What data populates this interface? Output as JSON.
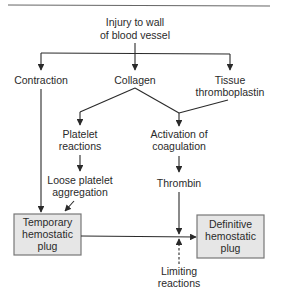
{
  "diagram": {
    "type": "flowchart",
    "colors": {
      "line": "#2a2a2a",
      "box_fill": "#e6e6e6",
      "box_border": "#777777",
      "background": "#ffffff"
    },
    "nodes": {
      "injury": {
        "line1": "Injury to wall",
        "line2": "of blood vessel"
      },
      "contraction": {
        "line1": "Contraction"
      },
      "collagen": {
        "line1": "Collagen"
      },
      "tissue": {
        "line1": "Tissue",
        "line2": "thromboplastin"
      },
      "platelet_reactions": {
        "line1": "Platelet",
        "line2": "reactions"
      },
      "activation": {
        "line1": "Activation of",
        "line2": "coagulation"
      },
      "loose": {
        "line1": "Loose platelet",
        "line2": "aggregation"
      },
      "thrombin": {
        "line1": "Thrombin"
      },
      "temporary": {
        "line1": "Temporary",
        "line2": "hemostatic",
        "line3": "plug"
      },
      "definitive": {
        "line1": "Definitive",
        "line2": "hemostatic",
        "line3": "plug"
      },
      "limiting": {
        "line1": "Limiting",
        "line2": "reactions"
      }
    },
    "edges": [
      {
        "from": "injury",
        "to": "contraction"
      },
      {
        "from": "injury",
        "to": "collagen"
      },
      {
        "from": "injury",
        "to": "tissue"
      },
      {
        "from": "collagen",
        "to": "platelet_reactions"
      },
      {
        "from": "collagen",
        "to": "activation"
      },
      {
        "from": "tissue",
        "to": "activation"
      },
      {
        "from": "platelet_reactions",
        "to": "loose"
      },
      {
        "from": "activation",
        "to": "thrombin"
      },
      {
        "from": "contraction",
        "to": "temporary"
      },
      {
        "from": "loose",
        "to": "temporary"
      },
      {
        "from": "temporary",
        "to": "definitive"
      },
      {
        "from": "thrombin",
        "to": "definitive"
      },
      {
        "from": "limiting",
        "to": "definitive",
        "style": "dashed"
      }
    ]
  }
}
